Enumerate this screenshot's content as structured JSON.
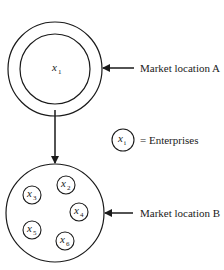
{
  "diagram": {
    "market_a": {
      "label": "Market location A",
      "enterprise": {
        "var": "x",
        "sub": "1"
      }
    },
    "market_b": {
      "label": "Market location B",
      "enterprises": [
        {
          "var": "x",
          "sub": "2"
        },
        {
          "var": "x",
          "sub": "3"
        },
        {
          "var": "x",
          "sub": "4"
        },
        {
          "var": "x",
          "sub": "5"
        },
        {
          "var": "x",
          "sub": "6"
        }
      ]
    },
    "legend": {
      "var": "x",
      "sub": "i",
      "text": "= Enterprises"
    },
    "colors": {
      "stroke": "#1a1a1a",
      "background": "#ffffff"
    }
  }
}
